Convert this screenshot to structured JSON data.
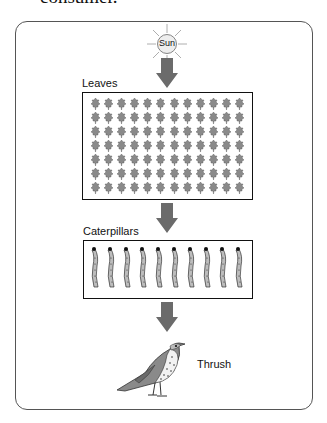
{
  "caption": "consumer.",
  "diagram": {
    "sun": {
      "label": "Sun"
    },
    "levels": [
      {
        "label": "Leaves",
        "count": 84,
        "columns": 12,
        "rows": 7
      },
      {
        "label": "Caterpillars",
        "count": 10
      },
      {
        "label": "Thrush",
        "count": 1
      }
    ],
    "colors": {
      "arrow": "#6b6b6b",
      "leaf": "#8a8a8a",
      "caterpillar": "#bdbdbd",
      "border": "#111111"
    }
  }
}
